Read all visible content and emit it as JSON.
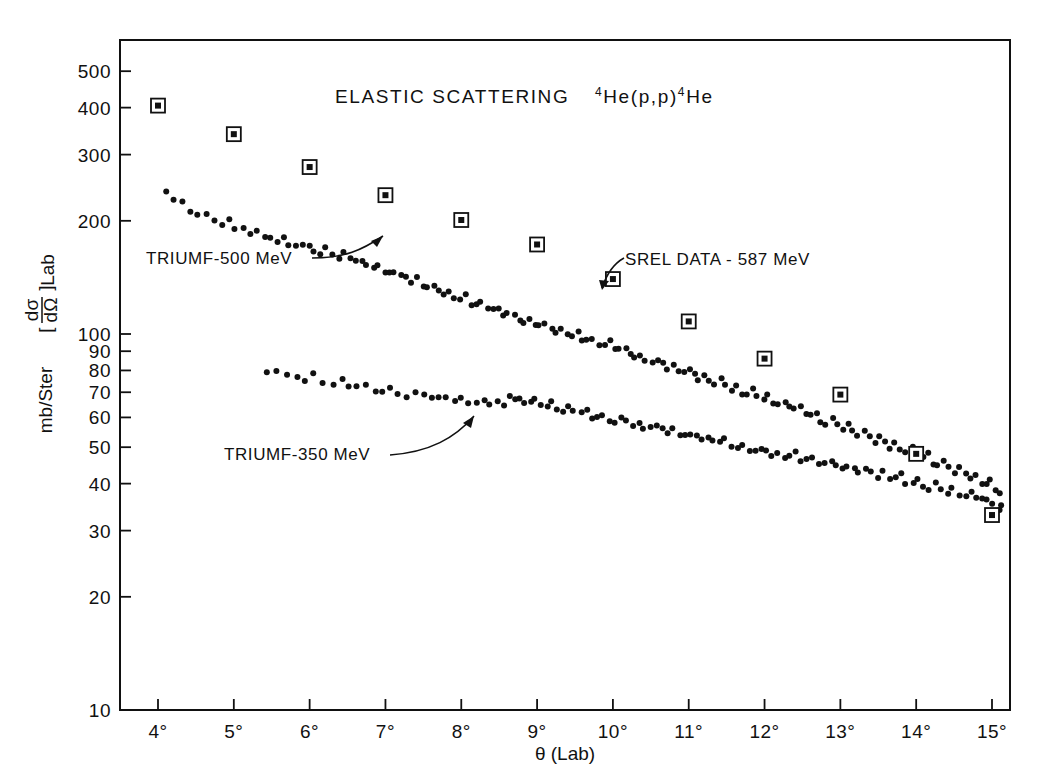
{
  "figure": {
    "title_main": "ELASTIC  SCATTERING",
    "title_reaction_pre": "4",
    "title_reaction_mid": "He(p,p)",
    "title_reaction_sup2": "4",
    "title_reaction_end": "He",
    "background": "#ffffff",
    "ink": "#111111"
  },
  "chart_data": {
    "type": "scatter",
    "title": "ELASTIC SCATTERING 4He(p,p)4He",
    "xlabel": "θ (Lab)",
    "ylabel": "[dσ/dΩ]_Lab  mb/Ster",
    "xscale": "linear",
    "yscale": "log",
    "xlim": [
      3.5,
      15.25
    ],
    "ylim": [
      10,
      560
    ],
    "grid": false,
    "legend_position": "inline-annotations",
    "xticks": [
      4,
      5,
      6,
      7,
      8,
      9,
      10,
      11,
      12,
      13,
      14,
      15
    ],
    "xticklabels": [
      "4°",
      "5°",
      "6°",
      "7°",
      "8°",
      "9°",
      "10°",
      "11°",
      "12°",
      "13°",
      "14°",
      "15°"
    ],
    "yticks": [
      10,
      20,
      30,
      40,
      50,
      60,
      70,
      80,
      90,
      100,
      200,
      300,
      400,
      500
    ],
    "yticklabels": [
      "10",
      "20",
      "30",
      "40",
      "50",
      "60",
      "70",
      "80",
      "90",
      "100",
      "200",
      "300",
      "400",
      "500"
    ],
    "series": [
      {
        "name": "SREL DATA - 587 MeV",
        "marker": "open-square-with-dot",
        "annotation": "SREL DATA - 587 MeV",
        "points": [
          [
            4.0,
            405
          ],
          [
            5.0,
            340
          ],
          [
            6.0,
            278
          ],
          [
            7.0,
            234
          ],
          [
            8.0,
            201
          ],
          [
            9.0,
            173
          ],
          [
            10.0,
            140
          ],
          [
            11.0,
            108
          ],
          [
            12.0,
            86
          ],
          [
            13.0,
            69
          ],
          [
            14.0,
            48
          ],
          [
            15.0,
            33
          ]
        ]
      },
      {
        "name": "TRIUMF - 500 MeV",
        "marker": "filled-circle",
        "annotation": "TRIUMF-500 MeV",
        "points": [
          [
            4.12,
            236
          ],
          [
            4.22,
            226
          ],
          [
            4.32,
            222
          ],
          [
            4.43,
            213
          ],
          [
            4.53,
            207
          ],
          [
            4.62,
            210
          ],
          [
            4.73,
            200
          ],
          [
            4.83,
            197
          ],
          [
            4.92,
            203
          ],
          [
            5.02,
            193
          ],
          [
            5.12,
            190
          ],
          [
            5.21,
            187
          ],
          [
            5.31,
            190
          ],
          [
            5.4,
            183
          ],
          [
            5.49,
            180
          ],
          [
            5.57,
            178
          ],
          [
            5.66,
            182
          ],
          [
            5.74,
            175
          ],
          [
            5.82,
            172
          ],
          [
            5.91,
            170
          ],
          [
            5.99,
            174
          ],
          [
            6.07,
            168
          ],
          [
            6.14,
            165
          ],
          [
            6.22,
            168
          ],
          [
            6.3,
            162
          ],
          [
            6.38,
            160
          ],
          [
            6.45,
            163
          ],
          [
            6.53,
            157
          ],
          [
            6.6,
            155
          ],
          [
            6.68,
            158
          ],
          [
            6.75,
            152
          ],
          [
            6.83,
            150
          ],
          [
            6.9,
            153
          ],
          [
            6.98,
            147
          ],
          [
            7.05,
            145
          ],
          [
            7.12,
            148
          ],
          [
            7.2,
            142
          ],
          [
            7.27,
            140
          ],
          [
            7.34,
            138
          ],
          [
            7.42,
            141
          ],
          [
            7.49,
            135
          ],
          [
            7.56,
            133
          ],
          [
            7.63,
            136
          ],
          [
            7.7,
            130
          ],
          [
            7.78,
            128
          ],
          [
            7.85,
            131
          ],
          [
            7.92,
            125
          ],
          [
            7.99,
            124
          ],
          [
            8.06,
            127
          ],
          [
            8.13,
            121
          ],
          [
            8.2,
            119
          ],
          [
            8.27,
            122
          ],
          [
            8.34,
            117
          ],
          [
            8.41,
            115
          ],
          [
            8.48,
            118
          ],
          [
            8.55,
            113
          ],
          [
            8.62,
            112
          ],
          [
            8.69,
            114
          ],
          [
            8.76,
            110
          ],
          [
            8.83,
            108
          ],
          [
            8.9,
            111
          ],
          [
            8.97,
            106
          ],
          [
            9.04,
            105
          ],
          [
            9.11,
            107
          ],
          [
            9.18,
            103
          ],
          [
            9.25,
            101
          ],
          [
            9.32,
            104
          ],
          [
            9.39,
            100
          ],
          [
            9.46,
            98.5
          ],
          [
            9.53,
            100.5
          ],
          [
            9.6,
            97
          ],
          [
            9.67,
            96
          ],
          [
            9.74,
            98
          ],
          [
            9.81,
            94
          ],
          [
            9.88,
            93
          ],
          [
            9.95,
            95
          ],
          [
            10.02,
            91
          ],
          [
            10.09,
            90
          ],
          [
            10.16,
            92
          ],
          [
            10.23,
            88.5
          ],
          [
            10.3,
            87
          ],
          [
            10.37,
            89
          ],
          [
            10.44,
            85.5
          ],
          [
            10.51,
            84
          ],
          [
            10.58,
            86
          ],
          [
            10.65,
            83
          ],
          [
            10.72,
            81.5
          ],
          [
            10.79,
            83.5
          ],
          [
            10.86,
            80
          ],
          [
            10.93,
            79
          ],
          [
            11.0,
            81
          ],
          [
            11.07,
            78
          ],
          [
            11.14,
            76.5
          ],
          [
            11.21,
            78.5
          ],
          [
            11.28,
            75
          ],
          [
            11.35,
            74
          ],
          [
            11.42,
            76
          ],
          [
            11.49,
            73
          ],
          [
            11.56,
            71.5
          ],
          [
            11.63,
            73.5
          ],
          [
            11.7,
            70
          ],
          [
            11.77,
            69
          ],
          [
            11.84,
            71
          ],
          [
            11.91,
            68
          ],
          [
            11.98,
            67
          ],
          [
            12.05,
            68.5
          ],
          [
            12.12,
            65.5
          ],
          [
            12.19,
            64.5
          ],
          [
            12.26,
            66.5
          ],
          [
            12.33,
            63.5
          ],
          [
            12.4,
            62.5
          ],
          [
            12.47,
            64
          ],
          [
            12.54,
            61
          ],
          [
            12.61,
            60.5
          ],
          [
            12.68,
            62
          ],
          [
            12.75,
            59
          ],
          [
            12.82,
            58
          ],
          [
            12.89,
            60
          ],
          [
            12.96,
            57
          ],
          [
            13.03,
            56
          ],
          [
            13.1,
            57.5
          ],
          [
            13.17,
            55
          ],
          [
            13.24,
            54
          ],
          [
            13.31,
            55.5
          ],
          [
            13.38,
            53
          ],
          [
            13.45,
            52
          ],
          [
            13.52,
            53.5
          ],
          [
            13.59,
            51
          ],
          [
            13.66,
            50
          ],
          [
            13.73,
            51.5
          ],
          [
            13.8,
            49
          ],
          [
            13.87,
            48.5
          ],
          [
            13.94,
            50
          ],
          [
            14.01,
            47.5
          ],
          [
            14.08,
            46.5
          ],
          [
            14.15,
            48
          ],
          [
            14.22,
            45.5
          ],
          [
            14.29,
            45
          ],
          [
            14.36,
            46
          ],
          [
            14.43,
            44
          ],
          [
            14.5,
            43
          ],
          [
            14.57,
            44.5
          ],
          [
            14.64,
            42
          ],
          [
            14.71,
            41.5
          ],
          [
            14.78,
            42.5
          ],
          [
            14.85,
            40.5
          ],
          [
            14.92,
            39.5
          ],
          [
            14.99,
            41
          ],
          [
            15.05,
            38.5
          ],
          [
            15.1,
            37.5
          ]
        ]
      },
      {
        "name": "TRIUMF - 350 MeV",
        "marker": "filled-circle",
        "annotation": "TRIUMF-350 MeV",
        "points": [
          [
            5.45,
            80
          ],
          [
            5.57,
            78.5
          ],
          [
            5.7,
            79
          ],
          [
            5.82,
            77
          ],
          [
            5.94,
            76
          ],
          [
            6.06,
            77.5
          ],
          [
            6.18,
            75
          ],
          [
            6.3,
            74
          ],
          [
            6.42,
            76
          ],
          [
            6.53,
            73
          ],
          [
            6.64,
            72
          ],
          [
            6.75,
            73.5
          ],
          [
            6.86,
            71
          ],
          [
            6.97,
            70.5
          ],
          [
            7.08,
            72
          ],
          [
            7.18,
            69.5
          ],
          [
            7.29,
            69
          ],
          [
            7.39,
            70
          ],
          [
            7.49,
            68
          ],
          [
            7.6,
            67.5
          ],
          [
            7.7,
            68.5
          ],
          [
            7.8,
            67
          ],
          [
            7.9,
            66.5
          ],
          [
            8.0,
            67.5
          ],
          [
            8.1,
            66
          ],
          [
            8.19,
            65.5
          ],
          [
            8.29,
            66.5
          ],
          [
            8.39,
            65
          ],
          [
            8.48,
            65.8
          ],
          [
            8.58,
            64.5
          ],
          [
            8.64,
            68.5
          ],
          [
            8.7,
            67
          ],
          [
            8.76,
            68
          ],
          [
            8.83,
            66.5
          ],
          [
            8.9,
            66
          ],
          [
            8.97,
            67
          ],
          [
            9.04,
            65
          ],
          [
            9.12,
            64.5
          ],
          [
            9.19,
            65.5
          ],
          [
            9.27,
            63.5
          ],
          [
            9.34,
            63
          ],
          [
            9.42,
            64
          ],
          [
            9.49,
            62
          ],
          [
            9.57,
            61.5
          ],
          [
            9.64,
            62.5
          ],
          [
            9.72,
            60.5
          ],
          [
            9.8,
            60
          ],
          [
            9.87,
            61
          ],
          [
            9.95,
            59
          ],
          [
            10.02,
            58.5
          ],
          [
            10.1,
            59.5
          ],
          [
            10.18,
            58
          ],
          [
            10.25,
            57.5
          ],
          [
            10.33,
            58.5
          ],
          [
            10.41,
            56.5
          ],
          [
            10.48,
            56
          ],
          [
            10.56,
            57
          ],
          [
            10.64,
            55.5
          ],
          [
            10.71,
            55
          ],
          [
            10.79,
            56
          ],
          [
            10.87,
            54
          ],
          [
            10.94,
            53.5
          ],
          [
            11.02,
            54.5
          ],
          [
            11.1,
            53
          ],
          [
            11.18,
            52.5
          ],
          [
            11.25,
            53.5
          ],
          [
            11.33,
            51.5
          ],
          [
            11.41,
            51
          ],
          [
            11.48,
            52
          ],
          [
            11.56,
            50.5
          ],
          [
            11.64,
            50
          ],
          [
            11.71,
            51
          ],
          [
            11.79,
            49.5
          ],
          [
            11.87,
            49
          ],
          [
            11.95,
            50
          ],
          [
            12.02,
            48.5
          ],
          [
            12.1,
            48
          ],
          [
            12.18,
            48.8
          ],
          [
            12.25,
            47.5
          ],
          [
            12.33,
            47
          ],
          [
            12.41,
            48
          ],
          [
            12.48,
            46.5
          ],
          [
            12.56,
            46
          ],
          [
            12.64,
            47
          ],
          [
            12.72,
            45.5
          ],
          [
            12.79,
            45
          ],
          [
            12.87,
            46
          ],
          [
            12.95,
            44.5
          ],
          [
            13.02,
            44
          ],
          [
            13.1,
            45
          ],
          [
            13.18,
            43.5
          ],
          [
            13.25,
            43
          ],
          [
            13.33,
            44
          ],
          [
            13.41,
            42.5
          ],
          [
            13.48,
            42
          ],
          [
            13.56,
            43
          ],
          [
            13.64,
            41.5
          ],
          [
            13.72,
            41
          ],
          [
            13.79,
            42
          ],
          [
            13.87,
            40.5
          ],
          [
            13.95,
            40
          ],
          [
            14.02,
            40.8
          ],
          [
            14.1,
            39.5
          ],
          [
            14.18,
            39
          ],
          [
            14.25,
            40
          ],
          [
            14.33,
            38.5
          ],
          [
            14.41,
            38
          ],
          [
            14.48,
            38.8
          ],
          [
            14.56,
            37.5
          ],
          [
            14.64,
            37
          ],
          [
            14.71,
            37.8
          ],
          [
            14.79,
            36.5
          ],
          [
            14.87,
            36
          ],
          [
            14.94,
            36.8
          ],
          [
            15.02,
            35
          ],
          [
            15.08,
            34.5
          ],
          [
            15.12,
            35.5
          ]
        ]
      }
    ],
    "annotations": [
      {
        "id": "annot-500",
        "text": "TRIUMF-500 MeV",
        "x": 4.25,
        "y": 150
      },
      {
        "id": "annot-350",
        "text": "TRIUMF-350 MeV",
        "x": 4.95,
        "y": 54
      },
      {
        "id": "annot-srel",
        "text": "SREL DATA - 587 MeV",
        "x": 10.25,
        "y": 155
      }
    ]
  },
  "labels": {
    "xaxis": "θ (Lab)",
    "yaxis_units": "mb/Ster",
    "yaxis_bracket_open": "[",
    "yaxis_num": "dσ",
    "yaxis_den": "dΩ",
    "yaxis_bracket_close": "]",
    "yaxis_sub": "Lab",
    "annot_500": "TRIUMF-500 MeV",
    "annot_350": "TRIUMF-350 MeV",
    "annot_srel": "SREL DATA - 587 MeV"
  }
}
